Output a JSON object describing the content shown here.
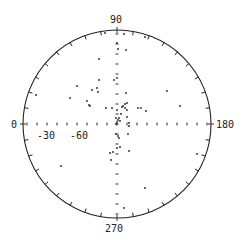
{
  "chart_data": {
    "type": "scatter",
    "subtype": "polar-stereonet",
    "title": "",
    "azimuth_labels": [
      {
        "text": "90",
        "angle": 90
      },
      {
        "text": "0",
        "angle": 0
      },
      {
        "text": "180",
        "angle": 180
      },
      {
        "text": "270",
        "angle": 270
      }
    ],
    "radial_labels": [
      "-30",
      "-60"
    ],
    "tick_spacing_deg": 10,
    "grid": false,
    "points_px": [
      [
        105,
        33
      ],
      [
        124,
        34
      ],
      [
        145,
        37
      ],
      [
        117,
        43
      ],
      [
        118,
        49
      ],
      [
        126,
        50
      ],
      [
        99,
        59
      ],
      [
        114,
        80
      ],
      [
        99,
        80
      ],
      [
        117,
        78
      ],
      [
        77,
        86
      ],
      [
        97,
        88
      ],
      [
        92,
        90
      ],
      [
        98,
        92
      ],
      [
        36,
        95
      ],
      [
        70,
        98
      ],
      [
        167,
        91
      ],
      [
        180,
        106
      ],
      [
        87,
        101
      ],
      [
        89,
        105
      ],
      [
        90,
        106
      ],
      [
        126,
        93
      ],
      [
        127,
        103
      ],
      [
        125,
        104
      ],
      [
        123,
        106
      ],
      [
        122,
        107
      ],
      [
        106,
        108
      ],
      [
        112,
        108
      ],
      [
        125,
        108
      ],
      [
        138,
        108
      ],
      [
        141,
        108
      ],
      [
        146,
        111
      ],
      [
        127,
        110
      ],
      [
        121,
        114
      ],
      [
        117,
        110
      ],
      [
        127,
        117
      ],
      [
        119,
        118
      ],
      [
        116,
        118
      ],
      [
        118,
        120
      ],
      [
        120,
        121
      ],
      [
        117,
        122
      ],
      [
        116,
        124
      ],
      [
        129,
        123
      ],
      [
        129,
        126
      ],
      [
        116,
        134
      ],
      [
        118,
        136
      ],
      [
        119,
        138
      ],
      [
        128,
        134
      ],
      [
        120,
        147
      ],
      [
        117,
        148
      ],
      [
        113,
        152
      ],
      [
        110,
        153
      ],
      [
        129,
        151
      ],
      [
        111,
        160
      ],
      [
        61,
        166
      ],
      [
        197,
        154
      ],
      [
        145,
        188
      ],
      [
        124,
        208
      ]
    ],
    "center_px": [
      117,
      124
    ],
    "radius_px": 94
  }
}
